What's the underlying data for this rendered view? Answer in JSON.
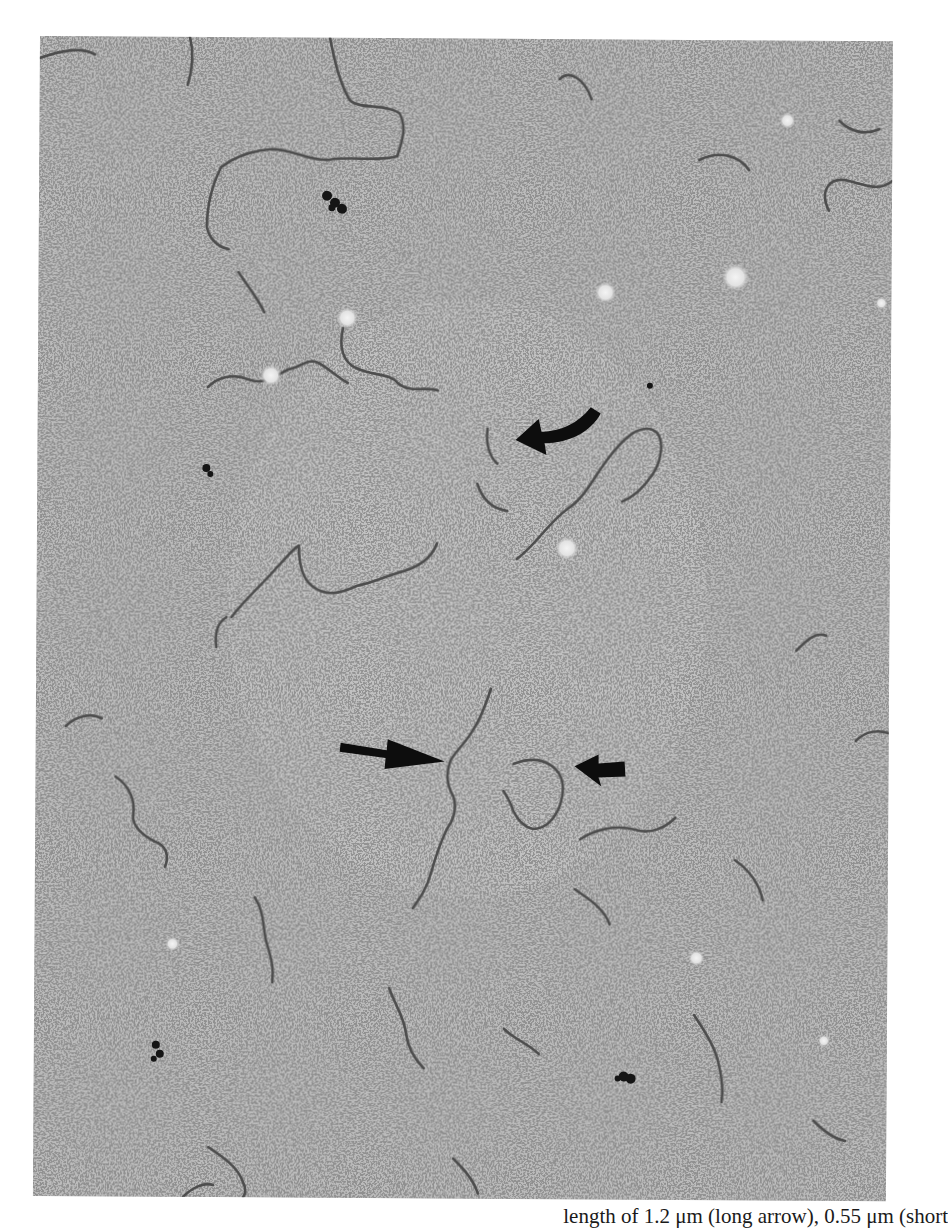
{
  "figure": {
    "type": "electron-micrograph",
    "background_color": "#b9b9b9",
    "grain_color": "#3a3a3a",
    "strand_color": "#4a4a4a",
    "arrow_color": "#0d0d0d",
    "annotations": [
      {
        "name": "curved-arrow",
        "points_to": "short circular/looped molecule (upper center)"
      },
      {
        "name": "long-arrow",
        "points_to": "long linear molecule (center)"
      },
      {
        "name": "short-arrow",
        "points_to": "small looped molecule (center right)"
      }
    ]
  },
  "caption": {
    "text": "length of 1.2 μm (long arrow), 0.55 μm (short"
  }
}
